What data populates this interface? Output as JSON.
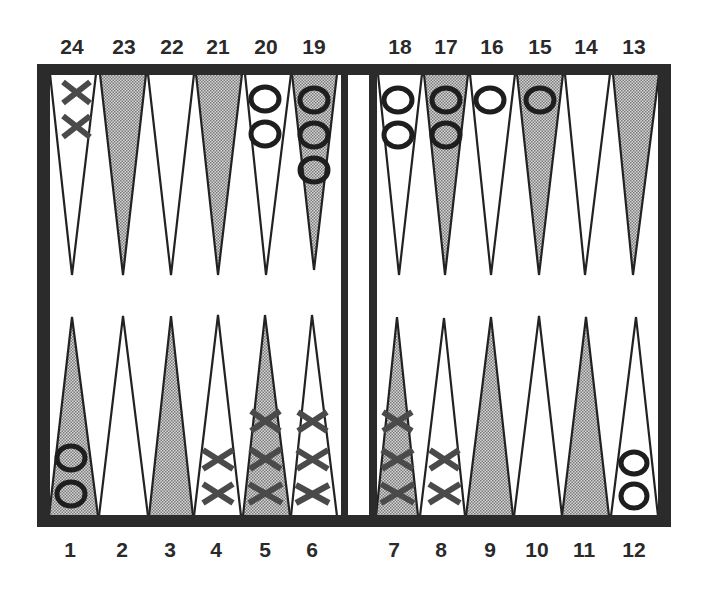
{
  "game": "Backgammon",
  "labels": {
    "top": [
      "24",
      "23",
      "22",
      "21",
      "20",
      "19",
      "18",
      "17",
      "16",
      "15",
      "14",
      "13"
    ],
    "bottom": [
      "1",
      "2",
      "3",
      "4",
      "5",
      "6",
      "7",
      "8",
      "9",
      "10",
      "11",
      "12"
    ]
  },
  "colors": {
    "frame": "#2b2b2b",
    "point_shaded": "#b8b8b8",
    "point_white": "#ffffff",
    "checker_o": "#1e1e1e",
    "checker_x": "#4a4a4a"
  },
  "points": [
    {
      "number": 24,
      "row": "top",
      "shaded": false,
      "checkers": {
        "type": "X",
        "count": 2
      }
    },
    {
      "number": 23,
      "row": "top",
      "shaded": true,
      "checkers": {
        "type": null,
        "count": 0
      }
    },
    {
      "number": 22,
      "row": "top",
      "shaded": false,
      "checkers": {
        "type": null,
        "count": 0
      }
    },
    {
      "number": 21,
      "row": "top",
      "shaded": true,
      "checkers": {
        "type": null,
        "count": 0
      }
    },
    {
      "number": 20,
      "row": "top",
      "shaded": false,
      "checkers": {
        "type": "O",
        "count": 2
      }
    },
    {
      "number": 19,
      "row": "top",
      "shaded": true,
      "checkers": {
        "type": "O",
        "count": 3
      }
    },
    {
      "number": 18,
      "row": "top",
      "shaded": false,
      "checkers": {
        "type": "O",
        "count": 2
      }
    },
    {
      "number": 17,
      "row": "top",
      "shaded": true,
      "checkers": {
        "type": "O",
        "count": 2
      }
    },
    {
      "number": 16,
      "row": "top",
      "shaded": false,
      "checkers": {
        "type": "O",
        "count": 1
      }
    },
    {
      "number": 15,
      "row": "top",
      "shaded": true,
      "checkers": {
        "type": "O",
        "count": 1
      }
    },
    {
      "number": 14,
      "row": "top",
      "shaded": false,
      "checkers": {
        "type": null,
        "count": 0
      }
    },
    {
      "number": 13,
      "row": "top",
      "shaded": true,
      "checkers": {
        "type": null,
        "count": 0
      }
    },
    {
      "number": 1,
      "row": "bottom",
      "shaded": true,
      "checkers": {
        "type": "O",
        "count": 2
      }
    },
    {
      "number": 2,
      "row": "bottom",
      "shaded": false,
      "checkers": {
        "type": null,
        "count": 0
      }
    },
    {
      "number": 3,
      "row": "bottom",
      "shaded": true,
      "checkers": {
        "type": null,
        "count": 0
      }
    },
    {
      "number": 4,
      "row": "bottom",
      "shaded": false,
      "checkers": {
        "type": "X",
        "count": 2
      }
    },
    {
      "number": 5,
      "row": "bottom",
      "shaded": true,
      "checkers": {
        "type": "X",
        "count": 3
      }
    },
    {
      "number": 6,
      "row": "bottom",
      "shaded": false,
      "checkers": {
        "type": "X",
        "count": 3
      }
    },
    {
      "number": 7,
      "row": "bottom",
      "shaded": true,
      "checkers": {
        "type": "X",
        "count": 3
      }
    },
    {
      "number": 8,
      "row": "bottom",
      "shaded": false,
      "checkers": {
        "type": "X",
        "count": 2
      }
    },
    {
      "number": 9,
      "row": "bottom",
      "shaded": true,
      "checkers": {
        "type": null,
        "count": 0
      }
    },
    {
      "number": 10,
      "row": "bottom",
      "shaded": false,
      "checkers": {
        "type": null,
        "count": 0
      }
    },
    {
      "number": 11,
      "row": "bottom",
      "shaded": true,
      "checkers": {
        "type": null,
        "count": 0
      }
    },
    {
      "number": 12,
      "row": "bottom",
      "shaded": false,
      "checkers": {
        "type": "O",
        "count": 2
      }
    }
  ]
}
